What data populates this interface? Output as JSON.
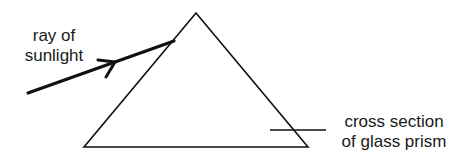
{
  "diagram": {
    "labels": {
      "ray_line1": "ray of",
      "ray_line2": "sunlight",
      "prism_line1": "cross section",
      "prism_line2": "of glass prism"
    },
    "colors": {
      "stroke": "#111111",
      "text": "#1a1a1a",
      "background": "#ffffff"
    }
  }
}
